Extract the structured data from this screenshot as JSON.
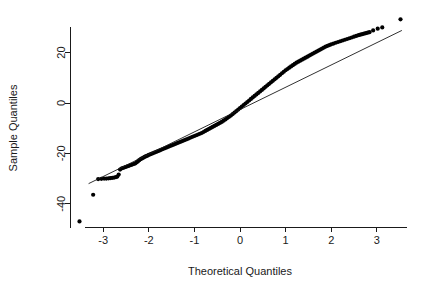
{
  "chart_data": {
    "type": "scatter",
    "title": "",
    "xlabel": "Theoretical Quantiles",
    "ylabel": "Sample Quantiles",
    "xlim": [
      -3.75,
      3.85
    ],
    "ylim": [
      -50.5,
      35.5
    ],
    "xticks": [
      -3,
      -2,
      -1,
      0,
      1,
      2,
      3
    ],
    "xticklabels": [
      "-3",
      "-2",
      "-1",
      "0",
      "1",
      "2",
      "3"
    ],
    "yticks": [
      20,
      0,
      -20,
      -40
    ],
    "yticklabels": [
      "20",
      "0",
      "-20",
      "-40"
    ],
    "grid": false,
    "legend": null,
    "reference_line": {
      "name": "qqline",
      "x": [
        -3.32,
        3.55
      ],
      "y": [
        -32.0,
        28.8
      ]
    },
    "series": [
      {
        "name": "sample-quantiles",
        "marker": "filled-circle",
        "color": "#000000",
        "points": [
          [
            -3.52,
            -47.0
          ],
          [
            -3.22,
            -36.4
          ],
          [
            -3.11,
            -30.2
          ],
          [
            -3.04,
            -30.1
          ],
          [
            -2.98,
            -30.0
          ],
          [
            -2.93,
            -30.0
          ],
          [
            -2.88,
            -29.9
          ],
          [
            -2.84,
            -29.8
          ],
          [
            -2.8,
            -29.7
          ],
          [
            -2.76,
            -29.6
          ],
          [
            -2.72,
            -29.4
          ],
          [
            -2.69,
            -29.2
          ],
          [
            -2.66,
            -28.4
          ],
          [
            -2.63,
            -26.4
          ],
          [
            -2.6,
            -26.0
          ],
          [
            -2.57,
            -25.8
          ],
          [
            -2.54,
            -25.6
          ],
          [
            -2.51,
            -25.4
          ],
          [
            -2.48,
            -25.2
          ],
          [
            -2.45,
            -25.0
          ],
          [
            -2.42,
            -24.8
          ],
          [
            -2.39,
            -24.6
          ],
          [
            -2.36,
            -24.4
          ],
          [
            -2.33,
            -24.2
          ],
          [
            -2.3,
            -24.0
          ],
          [
            -2.27,
            -23.6
          ],
          [
            -2.24,
            -23.2
          ],
          [
            -2.21,
            -22.7
          ],
          [
            -2.18,
            -22.3
          ],
          [
            -2.15,
            -22.0
          ],
          [
            -2.12,
            -21.7
          ],
          [
            -2.09,
            -21.4
          ],
          [
            -2.06,
            -21.1
          ],
          [
            -2.03,
            -20.9
          ],
          [
            -2.0,
            -20.6
          ],
          [
            -1.96,
            -20.3
          ],
          [
            -1.92,
            -20.0
          ],
          [
            -1.88,
            -19.7
          ],
          [
            -1.84,
            -19.4
          ],
          [
            -1.8,
            -19.1
          ],
          [
            -1.76,
            -18.8
          ],
          [
            -1.72,
            -18.5
          ],
          [
            -1.68,
            -18.2
          ],
          [
            -1.64,
            -17.9
          ],
          [
            -1.6,
            -17.6
          ],
          [
            -1.56,
            -17.3
          ],
          [
            -1.52,
            -17.0
          ],
          [
            -1.48,
            -16.7
          ],
          [
            -1.44,
            -16.4
          ],
          [
            -1.4,
            -16.1
          ],
          [
            -1.36,
            -15.8
          ],
          [
            -1.32,
            -15.5
          ],
          [
            -1.28,
            -15.2
          ],
          [
            -1.24,
            -14.9
          ],
          [
            -1.2,
            -14.6
          ],
          [
            -1.16,
            -14.3
          ],
          [
            -1.12,
            -14.0
          ],
          [
            -1.08,
            -13.7
          ],
          [
            -1.04,
            -13.4
          ],
          [
            -1.0,
            -13.1
          ],
          [
            -0.96,
            -12.8
          ],
          [
            -0.92,
            -12.5
          ],
          [
            -0.88,
            -12.2
          ],
          [
            -0.84,
            -11.9
          ],
          [
            -0.8,
            -11.5
          ],
          [
            -0.76,
            -11.1
          ],
          [
            -0.72,
            -10.7
          ],
          [
            -0.68,
            -10.3
          ],
          [
            -0.64,
            -9.9
          ],
          [
            -0.6,
            -9.5
          ],
          [
            -0.56,
            -9.1
          ],
          [
            -0.52,
            -8.7
          ],
          [
            -0.48,
            -8.3
          ],
          [
            -0.44,
            -7.9
          ],
          [
            -0.4,
            -7.5
          ],
          [
            -0.36,
            -7.0
          ],
          [
            -0.32,
            -6.5
          ],
          [
            -0.28,
            -6.0
          ],
          [
            -0.24,
            -5.5
          ],
          [
            -0.2,
            -5.0
          ],
          [
            -0.16,
            -4.4
          ],
          [
            -0.12,
            -3.8
          ],
          [
            -0.08,
            -3.2
          ],
          [
            -0.04,
            -2.6
          ],
          [
            0.0,
            -2.0
          ],
          [
            0.04,
            -1.4
          ],
          [
            0.08,
            -0.8
          ],
          [
            0.12,
            -0.2
          ],
          [
            0.16,
            0.4
          ],
          [
            0.2,
            1.0
          ],
          [
            0.24,
            1.6
          ],
          [
            0.28,
            2.2
          ],
          [
            0.32,
            2.8
          ],
          [
            0.36,
            3.4
          ],
          [
            0.4,
            4.0
          ],
          [
            0.44,
            4.6
          ],
          [
            0.48,
            5.2
          ],
          [
            0.52,
            5.8
          ],
          [
            0.56,
            6.4
          ],
          [
            0.6,
            7.0
          ],
          [
            0.64,
            7.6
          ],
          [
            0.68,
            8.2
          ],
          [
            0.72,
            8.8
          ],
          [
            0.76,
            9.4
          ],
          [
            0.8,
            10.0
          ],
          [
            0.84,
            10.6
          ],
          [
            0.88,
            11.2
          ],
          [
            0.92,
            11.8
          ],
          [
            0.96,
            12.4
          ],
          [
            1.0,
            13.0
          ],
          [
            1.04,
            13.5
          ],
          [
            1.08,
            14.0
          ],
          [
            1.12,
            14.5
          ],
          [
            1.16,
            15.0
          ],
          [
            1.2,
            15.5
          ],
          [
            1.24,
            16.0
          ],
          [
            1.28,
            16.4
          ],
          [
            1.32,
            16.8
          ],
          [
            1.36,
            17.2
          ],
          [
            1.4,
            17.6
          ],
          [
            1.44,
            18.0
          ],
          [
            1.48,
            18.4
          ],
          [
            1.52,
            18.8
          ],
          [
            1.56,
            19.2
          ],
          [
            1.6,
            19.6
          ],
          [
            1.64,
            20.0
          ],
          [
            1.68,
            20.4
          ],
          [
            1.72,
            20.8
          ],
          [
            1.76,
            21.2
          ],
          [
            1.8,
            21.6
          ],
          [
            1.84,
            22.0
          ],
          [
            1.88,
            22.4
          ],
          [
            1.92,
            22.7
          ],
          [
            1.96,
            23.0
          ],
          [
            2.0,
            23.3
          ],
          [
            2.05,
            23.6
          ],
          [
            2.1,
            23.9
          ],
          [
            2.15,
            24.2
          ],
          [
            2.2,
            24.5
          ],
          [
            2.25,
            24.8
          ],
          [
            2.3,
            25.1
          ],
          [
            2.35,
            25.4
          ],
          [
            2.4,
            25.7
          ],
          [
            2.45,
            26.0
          ],
          [
            2.5,
            26.3
          ],
          [
            2.55,
            26.6
          ],
          [
            2.6,
            26.9
          ],
          [
            2.64,
            27.1
          ],
          [
            2.68,
            27.3
          ],
          [
            2.72,
            27.5
          ],
          [
            2.76,
            27.7
          ],
          [
            2.8,
            27.9
          ],
          [
            2.84,
            28.1
          ],
          [
            2.92,
            28.8
          ],
          [
            3.02,
            29.5
          ],
          [
            3.12,
            30.0
          ],
          [
            3.52,
            33.2
          ]
        ]
      }
    ]
  },
  "axes": {
    "x_title": "Theoretical Quantiles",
    "y_title": "Sample Quantiles"
  }
}
